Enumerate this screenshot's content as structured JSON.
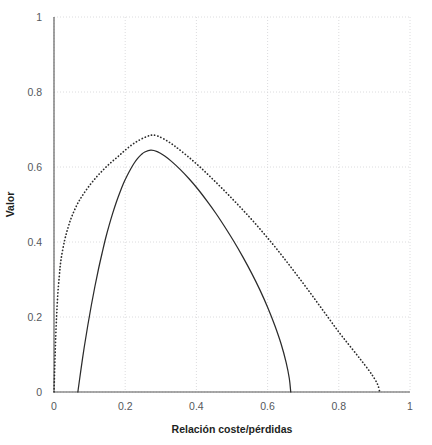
{
  "chart_data": {
    "type": "line",
    "title": "",
    "xlabel": "Relación coste/pérdidas",
    "ylabel": "Valor",
    "xlim": [
      0,
      1
    ],
    "ylim": [
      0,
      1
    ],
    "grid": true,
    "legend": "none",
    "xticks": [
      "0",
      "0.2",
      "0.4",
      "0.6",
      "0.8",
      "1"
    ],
    "xtick_values": [
      0,
      0.2,
      0.4,
      0.6,
      0.8,
      1
    ],
    "yticks": [
      "0",
      "0.2",
      "0.4",
      "0.6",
      "0.8",
      "1"
    ],
    "ytick_values": [
      0,
      0.2,
      0.4,
      0.6,
      0.8,
      1
    ],
    "series": [
      {
        "name": "dotted-curve",
        "style": "dotted",
        "color": "#2b2b2b",
        "peak": {
          "x": 0.275,
          "y": 0.685
        },
        "x_start": 0.0,
        "x_end": 0.915,
        "points": [
          [
            0.0,
            0.0
          ],
          [
            0.005,
            0.15
          ],
          [
            0.01,
            0.25
          ],
          [
            0.015,
            0.31
          ],
          [
            0.02,
            0.355
          ],
          [
            0.03,
            0.405
          ],
          [
            0.04,
            0.44
          ],
          [
            0.05,
            0.468
          ],
          [
            0.065,
            0.5
          ],
          [
            0.08,
            0.524
          ],
          [
            0.1,
            0.551
          ],
          [
            0.12,
            0.574
          ],
          [
            0.14,
            0.594
          ],
          [
            0.16,
            0.612
          ],
          [
            0.18,
            0.628
          ],
          [
            0.2,
            0.645
          ],
          [
            0.22,
            0.66
          ],
          [
            0.24,
            0.672
          ],
          [
            0.26,
            0.681
          ],
          [
            0.275,
            0.685
          ],
          [
            0.29,
            0.683
          ],
          [
            0.31,
            0.674
          ],
          [
            0.33,
            0.662
          ],
          [
            0.35,
            0.648
          ],
          [
            0.38,
            0.625
          ],
          [
            0.41,
            0.6
          ],
          [
            0.44,
            0.573
          ],
          [
            0.47,
            0.545
          ],
          [
            0.5,
            0.516
          ],
          [
            0.53,
            0.486
          ],
          [
            0.56,
            0.455
          ],
          [
            0.59,
            0.422
          ],
          [
            0.62,
            0.388
          ],
          [
            0.65,
            0.352
          ],
          [
            0.68,
            0.315
          ],
          [
            0.71,
            0.277
          ],
          [
            0.74,
            0.238
          ],
          [
            0.77,
            0.199
          ],
          [
            0.8,
            0.16
          ],
          [
            0.83,
            0.124
          ],
          [
            0.86,
            0.088
          ],
          [
            0.885,
            0.057
          ],
          [
            0.9,
            0.036
          ],
          [
            0.91,
            0.018
          ],
          [
            0.915,
            0.0
          ]
        ]
      },
      {
        "name": "solid-curve",
        "style": "solid",
        "color": "#2b2b2b",
        "peak": {
          "x": 0.272,
          "y": 0.645
        },
        "x_start": 0.067,
        "x_end": 0.665,
        "points": [
          [
            0.067,
            0.0
          ],
          [
            0.075,
            0.055
          ],
          [
            0.085,
            0.12
          ],
          [
            0.095,
            0.178
          ],
          [
            0.105,
            0.232
          ],
          [
            0.115,
            0.282
          ],
          [
            0.125,
            0.328
          ],
          [
            0.135,
            0.37
          ],
          [
            0.145,
            0.41
          ],
          [
            0.155,
            0.445
          ],
          [
            0.165,
            0.477
          ],
          [
            0.175,
            0.506
          ],
          [
            0.185,
            0.532
          ],
          [
            0.195,
            0.556
          ],
          [
            0.205,
            0.576
          ],
          [
            0.215,
            0.594
          ],
          [
            0.225,
            0.61
          ],
          [
            0.235,
            0.623
          ],
          [
            0.245,
            0.633
          ],
          [
            0.255,
            0.64
          ],
          [
            0.272,
            0.645
          ],
          [
            0.29,
            0.641
          ],
          [
            0.31,
            0.63
          ],
          [
            0.33,
            0.615
          ],
          [
            0.355,
            0.593
          ],
          [
            0.38,
            0.568
          ],
          [
            0.405,
            0.54
          ],
          [
            0.43,
            0.509
          ],
          [
            0.455,
            0.476
          ],
          [
            0.48,
            0.44
          ],
          [
            0.505,
            0.402
          ],
          [
            0.53,
            0.361
          ],
          [
            0.555,
            0.317
          ],
          [
            0.578,
            0.273
          ],
          [
            0.6,
            0.226
          ],
          [
            0.62,
            0.178
          ],
          [
            0.638,
            0.128
          ],
          [
            0.652,
            0.079
          ],
          [
            0.661,
            0.036
          ],
          [
            0.665,
            0.0
          ]
        ]
      }
    ]
  },
  "style": {
    "axis_color": "#555555",
    "grid_color": "#d8d8da",
    "tick_label_color": "#55585c",
    "axis_title_color": "#1d1f22",
    "background": "#ffffff"
  }
}
